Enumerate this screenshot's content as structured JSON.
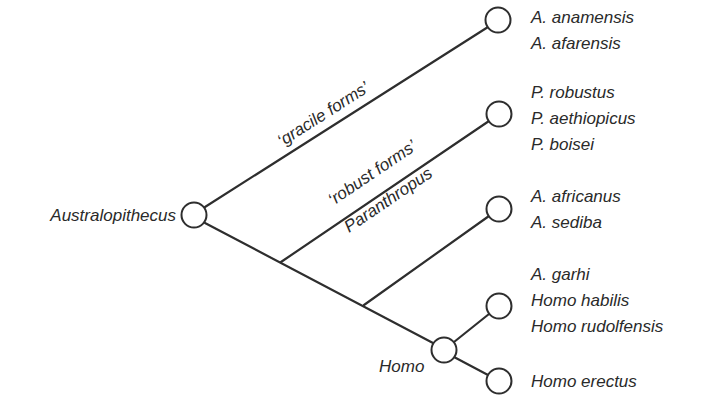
{
  "diagram": {
    "type": "phylogenetic tree",
    "root": {
      "label": "Australopithecus"
    },
    "branch_labels": {
      "gracile": "‘gracile forms’",
      "robust": "‘robust forms’",
      "paranthropus": "Paranthropus"
    },
    "homo_node": {
      "label": "Homo"
    },
    "clades": [
      {
        "id": "gracile",
        "species": [
          "A. anamensis",
          "A. afarensis"
        ]
      },
      {
        "id": "robust",
        "species": [
          "P. robustus",
          "P. aethiopicus",
          "P. boisei"
        ]
      },
      {
        "id": "africanus",
        "species": [
          "A. africanus",
          "A. sediba"
        ]
      },
      {
        "id": "early-homo",
        "species": [
          "A. garhi",
          "Homo habilis",
          "Homo rudolfensis"
        ]
      },
      {
        "id": "erectus",
        "species": [
          "Homo erectus"
        ]
      }
    ],
    "colors": {
      "line": "#2e2e2e",
      "text": "#2a2a2a",
      "background": "#ffffff"
    }
  }
}
